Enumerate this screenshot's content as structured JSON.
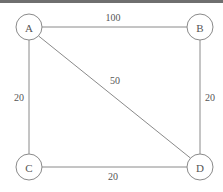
{
  "diagram": {
    "colors": {
      "background": "#ffffff",
      "stroke": "#8a8a8a",
      "text": "#555555",
      "top_rule": "#6f6f6f"
    },
    "nodes": [
      {
        "id": "A",
        "label": "A",
        "cx": 29,
        "cy": 27,
        "r": 13
      },
      {
        "id": "B",
        "label": "B",
        "cx": 200,
        "cy": 27,
        "r": 13
      },
      {
        "id": "C",
        "label": "C",
        "cx": 29,
        "cy": 167,
        "r": 13
      },
      {
        "id": "D",
        "label": "D",
        "cx": 200,
        "cy": 167,
        "r": 13
      }
    ],
    "edges": [
      {
        "id": "AB",
        "from": "A",
        "to": "B",
        "weight": "100",
        "label_x": 113,
        "label_y": 17
      },
      {
        "id": "AC",
        "from": "A",
        "to": "C",
        "weight": "20",
        "label_x": 19,
        "label_y": 97
      },
      {
        "id": "AD",
        "from": "A",
        "to": "D",
        "weight": "50",
        "label_x": 115,
        "label_y": 80
      },
      {
        "id": "BD",
        "from": "B",
        "to": "D",
        "weight": "20",
        "label_x": 210,
        "label_y": 97
      },
      {
        "id": "CD",
        "from": "C",
        "to": "D",
        "weight": "20",
        "label_x": 113,
        "label_y": 176
      }
    ]
  }
}
